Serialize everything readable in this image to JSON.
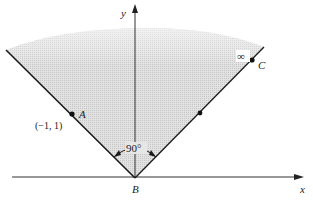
{
  "diagram": {
    "axes": {
      "x_label": "x",
      "y_label": "y"
    },
    "points": {
      "A": {
        "label": "A",
        "coord_label": "(−1, 1)"
      },
      "B": {
        "label": "B"
      },
      "C": {
        "label": "C",
        "marker": "∞"
      }
    },
    "angle_label": "90°",
    "colors": {
      "line": "#1a1a1a",
      "shade": "#d4d4d4",
      "background": "#ffffff"
    }
  }
}
